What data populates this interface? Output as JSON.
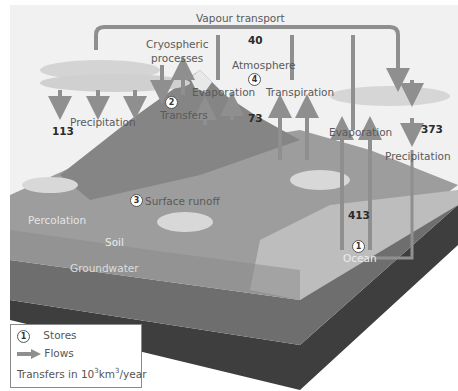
{
  "diagram": {
    "labels": {
      "vapour_transport": "Vapour transport",
      "cryospheric": "Cryospheric",
      "processes": "processes",
      "atmosphere": "Atmosphere",
      "transfers": "Transfers",
      "evaporation_land": "Evaporation",
      "transpiration": "Transpiration",
      "precipitation_land": "Precipitation",
      "evaporation_ocean": "Evaporation",
      "precipitation_ocean": "Precipitation",
      "surface_runoff": "Surface runoff",
      "percolation": "Percolation",
      "soil": "Soil",
      "groundwater": "Groundwater",
      "ocean": "Ocean"
    },
    "store_numbers": {
      "ocean": "1",
      "transfers": "2",
      "surface_runoff": "3",
      "atmosphere": "4"
    },
    "values": {
      "vapour_transport": "40",
      "precipitation_land": "113",
      "evapotranspiration_land": "73",
      "precipitation_ocean": "373",
      "evaporation_ocean": "413"
    },
    "colors": {
      "arrow": "#8f8f8f",
      "land": "#9a9a9a",
      "ocean": "#b5b5b5",
      "groundwater": "#4a4a4a",
      "sky": "#eeeeee"
    }
  },
  "legend": {
    "stores_symbol": "1",
    "stores_label": "Stores",
    "flows_label": "Flows",
    "units_prefix": "Transfers in 10",
    "units_exp1": "3",
    "units_mid": "km",
    "units_exp2": "3",
    "units_suffix": "/year"
  }
}
